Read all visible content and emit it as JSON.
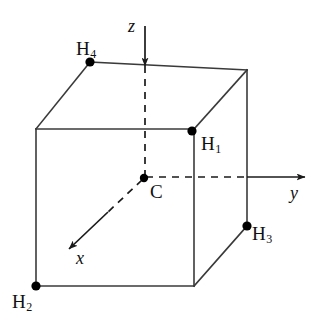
{
  "figure": {
    "background_color": "#ffffff",
    "line_color": "#3a3a3a",
    "axis_color": "#1a1a1a",
    "vertex_color": "#000000",
    "width": 322,
    "height": 324
  },
  "axes": [
    {
      "id": "z",
      "label": "z",
      "label_x": 128,
      "label_y": 17,
      "tip_x": 145,
      "tip_y": 20
    },
    {
      "id": "y",
      "label": "y",
      "label_x": 290,
      "label_y": 184,
      "tip_x": 307,
      "tip_y": 177
    },
    {
      "id": "x",
      "label": "x",
      "label_x": 76,
      "label_y": 249,
      "tip_x": 64,
      "tip_y": 253
    }
  ],
  "atoms": [
    {
      "id": "C",
      "label": "C",
      "sub": "",
      "dot_x": 144,
      "dot_y": 178,
      "label_x": 150,
      "label_y": 182
    },
    {
      "id": "H1",
      "label": "H",
      "sub": "1",
      "dot_x": 192,
      "dot_y": 131,
      "label_x": 201,
      "label_y": 134
    },
    {
      "id": "H2",
      "label": "H",
      "sub": "2",
      "dot_x": 36,
      "dot_y": 286,
      "label_x": 12,
      "label_y": 292
    },
    {
      "id": "H3",
      "label": "H",
      "sub": "3",
      "dot_x": 247,
      "dot_y": 226,
      "label_x": 252,
      "label_y": 224
    },
    {
      "id": "H4",
      "label": "H",
      "sub": "4",
      "dot_x": 90,
      "dot_y": 62,
      "label_x": 76,
      "label_y": 39
    }
  ],
  "cube": {
    "front_top_left": [
      36,
      129
    ],
    "front_top_right": [
      194,
      129
    ],
    "front_bottom_left": [
      36,
      286
    ],
    "front_bottom_right": [
      194,
      286
    ],
    "back_top_left": [
      90,
      62
    ],
    "back_top_right": [
      247,
      70
    ],
    "back_bottom_right": [
      247,
      226
    ]
  }
}
